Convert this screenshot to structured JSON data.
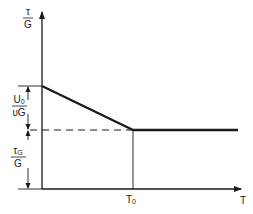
{
  "diagram": {
    "y_axis_label": {
      "numerator": "τ",
      "denominator": "G"
    },
    "x_axis_label": "T",
    "x_marker_label": {
      "base": "T",
      "sub": "0"
    },
    "upper_dimension_label": {
      "numerator_base": "U",
      "numerator_sub": "0",
      "denominator": "υG"
    },
    "lower_dimension_label": {
      "numerator_base": "τ",
      "numerator_sub": "G",
      "denominator": "G"
    },
    "line_color": "#1a1a1a"
  }
}
